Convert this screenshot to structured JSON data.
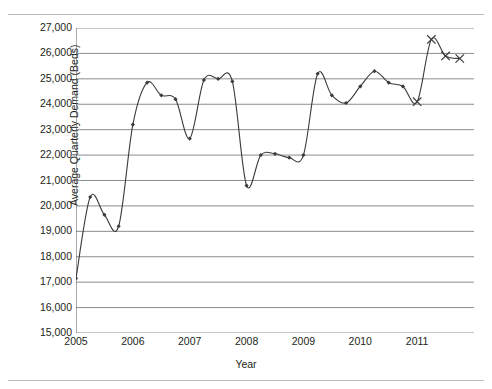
{
  "chart_data": {
    "type": "line",
    "title": "",
    "xlabel": "Year",
    "ylabel": "Average Quarterly Demand (Beds)",
    "ylim": [
      15000,
      27000
    ],
    "ytick_labels": [
      "27,000",
      "26,000",
      "25,000",
      "24,000",
      "23,000",
      "22,000",
      "21,000",
      "20,000",
      "19,000",
      "18,000",
      "17,000",
      "16,000",
      "15,000"
    ],
    "ytick_values": [
      27000,
      26000,
      25000,
      24000,
      23000,
      22000,
      21000,
      20000,
      19000,
      18000,
      17000,
      16000,
      15000
    ],
    "xtick_labels": [
      "2005",
      "2006",
      "2007",
      "2008",
      "2009",
      "2010",
      "2011"
    ],
    "xtick_values": [
      2005,
      2006,
      2007,
      2008,
      2009,
      2010,
      2011
    ],
    "xlim": [
      2005,
      2012
    ],
    "grid": true,
    "legend": "none",
    "marker_actual": "diamond",
    "marker_forecast": "x",
    "line_color": "#3a3a3a",
    "grid_color": "#898d91",
    "axis_color": "#58595b",
    "series": [
      {
        "name": "Average Quarterly Demand (Beds)",
        "x": [
          2005.0,
          2005.25,
          2005.5,
          2005.75,
          2006.0,
          2006.25,
          2006.5,
          2006.75,
          2007.0,
          2007.25,
          2007.5,
          2007.75,
          2008.0,
          2008.25,
          2008.5,
          2008.75,
          2009.0,
          2009.25,
          2009.5,
          2009.75,
          2010.0,
          2010.25,
          2010.5,
          2010.75,
          2011.0,
          2011.25,
          2011.5,
          2011.75
        ],
        "values": [
          17150,
          20350,
          19650,
          19200,
          23200,
          24850,
          24350,
          24200,
          22650,
          24950,
          25000,
          24900,
          20800,
          22000,
          22050,
          21900,
          22000,
          25200,
          24350,
          24050,
          24700,
          25300,
          24850,
          24700,
          24100,
          26550,
          25900,
          25800
        ],
        "kinds": [
          "actual",
          "actual",
          "actual",
          "actual",
          "actual",
          "actual",
          "actual",
          "actual",
          "actual",
          "actual",
          "actual",
          "actual",
          "actual",
          "actual",
          "actual",
          "actual",
          "actual",
          "actual",
          "actual",
          "actual",
          "actual",
          "actual",
          "actual",
          "actual",
          "forecast",
          "forecast",
          "forecast",
          "forecast"
        ]
      }
    ]
  }
}
